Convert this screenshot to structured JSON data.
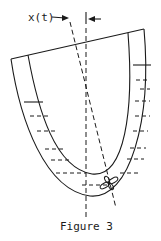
{
  "figure": {
    "displacement_label": "x(t)",
    "caption": "Figure 3",
    "ink_color": "#1a1a1a",
    "background_color": "#ffffff"
  }
}
